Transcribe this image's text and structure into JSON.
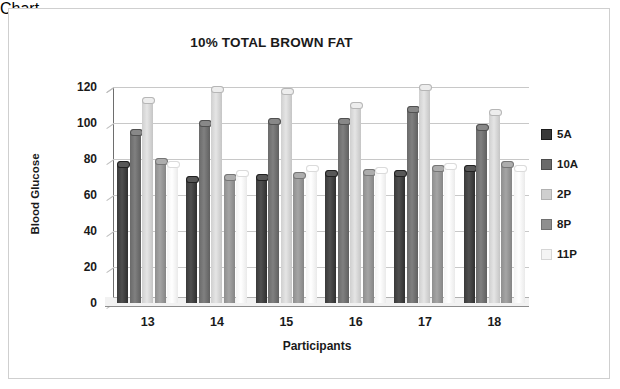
{
  "chart_data": {
    "type": "bar",
    "title": "10% TOTAL BROWN FAT",
    "xlabel": "Participants",
    "ylabel": "Blood Glucose",
    "categories": [
      "13",
      "14",
      "15",
      "16",
      "17",
      "18"
    ],
    "yticks": [
      "120",
      "100",
      "80",
      "60",
      "40",
      "20",
      "0"
    ],
    "ylim": [
      0,
      120
    ],
    "ytick_step": 20,
    "grid": true,
    "legend_position": "right",
    "series": [
      {
        "name": "5A",
        "color": "#3a3a3a",
        "values": [
          77,
          69,
          70,
          72,
          72,
          75
        ]
      },
      {
        "name": "10A",
        "color": "#6a6a6a",
        "values": [
          95,
          100,
          101,
          101,
          108,
          98
        ]
      },
      {
        "name": "2P",
        "color": "#cfcfcf",
        "values": [
          113,
          119,
          118,
          110,
          120,
          106
        ]
      },
      {
        "name": "8P",
        "color": "#8f8f8f",
        "values": [
          79,
          70,
          71,
          73,
          75,
          77
        ]
      },
      {
        "name": "11P",
        "color": "#f4f4f4",
        "values": [
          77,
          72,
          75,
          74,
          76,
          75
        ]
      }
    ]
  }
}
